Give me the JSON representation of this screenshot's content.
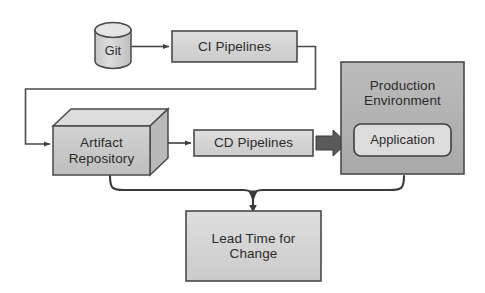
{
  "diagram": {
    "background_color": "#ffffff",
    "stroke_color": "#4a4a4a",
    "text_color": "#2b2b2b",
    "palette": {
      "box_fill_light": "#d4d4d4",
      "box_fill_mid": "#c9c9c9",
      "box_fill_dark": "#b3b3b3",
      "box_fill_darker": "#a8a8a8",
      "cylinder_fill": "#cfcfcf",
      "cylinder_top_fill": "#e2e2e2",
      "cube_top_fill": "#dcdcdc",
      "cube_side_fill": "#bdbdbd",
      "app_fill": "#d9d9d9",
      "block_arrow_fill": "#595959"
    }
  },
  "nodes": {
    "git": {
      "label": "Git",
      "shape": "cylinder",
      "name": "git-repository"
    },
    "ci_pipelines": {
      "label": "CI Pipelines",
      "shape": "rectangle",
      "name": "ci-pipelines"
    },
    "artifact_repository": {
      "label": "Artifact\nRepository",
      "shape": "cube",
      "name": "artifact-repository"
    },
    "cd_pipelines": {
      "label": "CD Pipelines",
      "shape": "rectangle",
      "name": "cd-pipelines"
    },
    "production_environment": {
      "label": "Production\nEnvironment",
      "shape": "rectangle",
      "name": "production-environment"
    },
    "application": {
      "label": "Application",
      "shape": "rounded-rectangle",
      "name": "application"
    },
    "lead_time": {
      "label": "Lead Time for\nChange",
      "shape": "rectangle",
      "name": "lead-time-for-change"
    }
  },
  "connectors": [
    {
      "name": "git-to-ci-pipelines",
      "from": "git",
      "to": "ci_pipelines",
      "style": "arrow"
    },
    {
      "name": "ci-pipelines-to-artifact-repository",
      "from": "ci_pipelines",
      "to": "artifact_repository",
      "style": "orthogonal-arrow"
    },
    {
      "name": "artifact-repository-to-cd-pipelines",
      "from": "artifact_repository",
      "to": "cd_pipelines",
      "style": "arrow"
    },
    {
      "name": "cd-pipelines-to-production-environment",
      "from": "cd_pipelines",
      "to": "production_environment",
      "style": "block-arrow"
    },
    {
      "name": "span-brace-to-lead-time",
      "from": "artifact_repository,production_environment",
      "to": "lead_time",
      "style": "brace"
    }
  ]
}
